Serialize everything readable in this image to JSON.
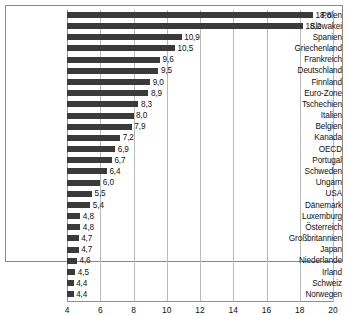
{
  "chart_data": {
    "type": "bar",
    "orientation": "horizontal",
    "title": "",
    "subtitle": "",
    "xlabel": "",
    "ylabel": "",
    "xlim": [
      4,
      20
    ],
    "xticks": [
      4,
      6,
      8,
      10,
      12,
      14,
      16,
      18,
      20
    ],
    "xtick_labels": [
      "4",
      "6",
      "8",
      "10",
      "12",
      "14",
      "16",
      "18",
      "20"
    ],
    "grid": "vertical",
    "legend": "none",
    "decimal_separator": ",",
    "bar_color": "#3a3a3a",
    "grid_color": "#b9b9b9",
    "frame_color": "#8a8a8a",
    "categories": [
      "Polen",
      "Slowakei",
      "Spanien",
      "Griechenland",
      "Frankreich",
      "Deutschland",
      "Finnland",
      "Euro-Zone",
      "Tschechien",
      "Italien",
      "Belgien",
      "Kanada",
      "OECD",
      "Portugal",
      "Schweden",
      "Ungarn",
      "USA",
      "Dänemark",
      "Luxemburg",
      "Österreich",
      "Großbritannien",
      "Japan",
      "Niederlande",
      "Irland",
      "Schweiz",
      "Norwegen"
    ],
    "values": [
      18.8,
      18.2,
      10.9,
      10.5,
      9.6,
      9.5,
      9.0,
      8.9,
      8.3,
      8.0,
      7.9,
      7.2,
      6.9,
      6.7,
      6.4,
      6.0,
      5.5,
      5.4,
      4.8,
      4.8,
      4.7,
      4.7,
      4.6,
      4.5,
      4.4,
      4.4
    ],
    "value_labels": [
      "18,8",
      "18,2",
      "10,9",
      "10,5",
      "9,6",
      "9,5",
      "9,0",
      "8,9",
      "8,3",
      "8,0",
      "7,9",
      "7,2",
      "6,9",
      "6,7",
      "6,4",
      "6,0",
      "5,5",
      "5,4",
      "4,8",
      "4,8",
      "4,7",
      "4,7",
      "4,6",
      "4,5",
      "4,4",
      "4,4"
    ]
  }
}
